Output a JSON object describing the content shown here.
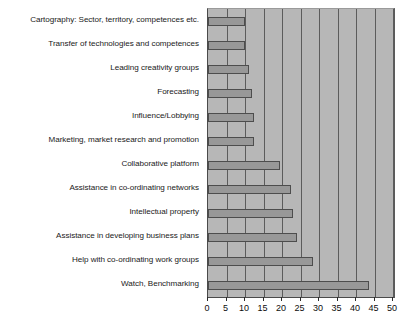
{
  "chart_data": {
    "type": "bar",
    "orientation": "horizontal",
    "title": "",
    "subtitle": "",
    "xlabel": "",
    "ylabel": "",
    "xlim": [
      0,
      50
    ],
    "xticks": [
      0,
      5,
      10,
      15,
      20,
      25,
      30,
      35,
      40,
      45,
      50
    ],
    "grid": true,
    "legend": null,
    "legend_position": "none",
    "colors": {
      "bar_fill": "#989898",
      "bar_edge": "#4d4d4d",
      "plot_background": "#b7b7b7",
      "gridline": "#5c5c5c",
      "text": "#1a1a1a"
    },
    "categories": [
      "Cartography: Sector, territory, competences etc.",
      "Transfer of technologies and competences",
      "Leading creativity groups",
      "Forecasting",
      "Influence/Lobbying",
      "Marketing, market research and promotion",
      "Collaborative platform",
      "Assistance in co-ordinating networks",
      "Intellectual property",
      "Assistance in developing business plans",
      "Help with co-ordinating work groups",
      "Watch, Benchmarking"
    ],
    "values": [
      10,
      10,
      11,
      12,
      12.5,
      12.5,
      19.5,
      22.5,
      23,
      24,
      28.5,
      43.5
    ]
  }
}
